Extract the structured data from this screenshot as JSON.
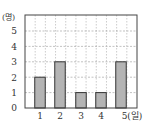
{
  "chart_data": {
    "type": "bar",
    "title": "",
    "xlabel": "(일)",
    "ylabel": "(명)",
    "categories": [
      "1",
      "2",
      "3",
      "4",
      "5"
    ],
    "values": [
      2,
      3,
      1,
      1,
      3
    ],
    "ylim": [
      0,
      6
    ],
    "yticks": [
      0,
      1,
      2,
      3,
      4,
      5
    ],
    "grid": true,
    "legend": null,
    "colors": {
      "bar_fill": "#b4b4b4",
      "bar_stroke": "#333333",
      "grid": "#999999",
      "frame": "#444444"
    }
  },
  "labels": {
    "y_unit": "(명)",
    "x_last": "5(일)",
    "y_ticks": [
      "0",
      "1",
      "2",
      "3",
      "4",
      "5"
    ],
    "x_ticks": [
      "1",
      "2",
      "3",
      "4"
    ]
  }
}
